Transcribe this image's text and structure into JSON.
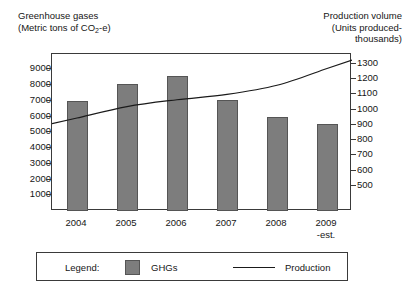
{
  "chart_data": {
    "type": "bar",
    "title": "",
    "categories": [
      "2004",
      "2005",
      "2006",
      "2007",
      "2008",
      "2009\n-est."
    ],
    "series": [
      {
        "name": "GHGs",
        "type": "bar",
        "axis": "left",
        "values": [
          7000,
          8100,
          8550,
          7050,
          6000,
          5500
        ]
      },
      {
        "name": "Production",
        "type": "line",
        "axis": "right",
        "values": [
          945,
          1020,
          1065,
          1100,
          1160,
          1270
        ]
      }
    ],
    "left_axis": {
      "label_line1": "Greenhouse gases",
      "label_line2": "(Metric tons of CO2-e)",
      "ticks": [
        1000,
        2000,
        3000,
        4000,
        5000,
        6000,
        7000,
        8000,
        9000
      ],
      "ylim": [
        0,
        9980
      ]
    },
    "right_axis": {
      "label_line1": "Production volume",
      "label_line2": "(Units produced-",
      "label_line3": "thousands)",
      "ticks": [
        500,
        600,
        700,
        800,
        900,
        1000,
        1100,
        1200,
        1300
      ],
      "ylim": [
        335,
        1365
      ]
    },
    "grid": false,
    "legend_position": "bottom",
    "colors": {
      "bar_fill": "#7d7d7d",
      "bar_stroke": "#555555",
      "line": "#1a1a1a",
      "frame": "#3a3a3a",
      "text": "#161616"
    }
  },
  "left_axis_title": {
    "line1": "Greenhouse gases",
    "line2_pre": "(Metric tons of CO",
    "line2_sub": "2",
    "line2_post": "-e)"
  },
  "right_axis_title": {
    "line1": "Production volume",
    "line2": "(Units produced-",
    "line3": "thousands)"
  },
  "categories": [
    {
      "main": "2004",
      "sub": ""
    },
    {
      "main": "2005",
      "sub": ""
    },
    {
      "main": "2006",
      "sub": ""
    },
    {
      "main": "2007",
      "sub": ""
    },
    {
      "main": "2008",
      "sub": ""
    },
    {
      "main": "2009",
      "sub": "-est."
    }
  ],
  "left_ticks": [
    "9000",
    "8000",
    "7000",
    "6000",
    "5000",
    "4000",
    "3000",
    "2000",
    "1000"
  ],
  "right_ticks": [
    "1300",
    "1200",
    "1100",
    "1000",
    "900",
    "800",
    "700",
    "600",
    "500"
  ],
  "legend": {
    "title": "Legend:",
    "bar_label": "GHGs",
    "line_label": "Production"
  }
}
